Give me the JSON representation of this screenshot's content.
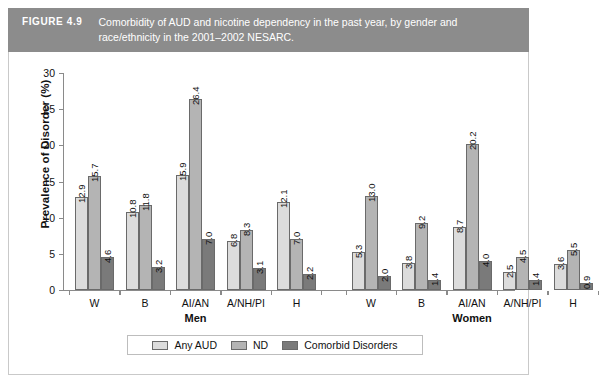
{
  "figure": {
    "number_label": "FIGURE 4.9",
    "caption": "Comorbidity of AUD and nicotine dependency in the past year, by gender and race/ethnicity in the 2001–2002 NESARC."
  },
  "chart_data": {
    "type": "bar",
    "title": "",
    "xlabel": "",
    "ylabel": "Prevalence of Disorder (%)",
    "ylim": [
      0,
      30
    ],
    "yticks": [
      0,
      5,
      10,
      15,
      20,
      25,
      30
    ],
    "ytick_labels": [
      "0",
      "5",
      "10",
      "15",
      "20",
      "25",
      "30"
    ],
    "grid": false,
    "legend_position": "bottom",
    "panels": [
      {
        "name": "Men",
        "categories": [
          "W",
          "B",
          "AI/AN",
          "A/NH/PI",
          "H"
        ]
      },
      {
        "name": "Women",
        "categories": [
          "W",
          "B",
          "AI/AN",
          "A/NH/PI",
          "H"
        ]
      }
    ],
    "categories": [
      "W",
      "B",
      "AI/AN",
      "A/NH/PI",
      "H",
      "W",
      "B",
      "AI/AN",
      "A/NH/PI",
      "H"
    ],
    "series": [
      {
        "name": "Any AUD",
        "color": "#dcdcdc",
        "values": [
          12.9,
          10.8,
          15.9,
          6.8,
          12.1,
          5.3,
          3.8,
          8.7,
          2.5,
          3.6
        ]
      },
      {
        "name": "ND",
        "color": "#b4b4b4",
        "values": [
          15.7,
          11.8,
          26.4,
          8.3,
          7.0,
          13.0,
          9.2,
          20.2,
          4.5,
          5.5
        ]
      },
      {
        "name": "Comorbid Disorders",
        "color": "#7a7a7a",
        "values": [
          4.6,
          3.2,
          7.0,
          3.1,
          2.2,
          2.0,
          1.4,
          4.0,
          1.4,
          0.9
        ]
      }
    ],
    "value_labels": [
      [
        "12.9",
        "15.7",
        "4.6"
      ],
      [
        "10.8",
        "11.8",
        "3.2"
      ],
      [
        "15.9",
        "26.4",
        "7.0"
      ],
      [
        "6.8",
        "8.3",
        "3.1"
      ],
      [
        "12.1",
        "7.0",
        "2.2"
      ],
      [
        "5.3",
        "13.0",
        "2.0"
      ],
      [
        "3.8",
        "9.2",
        "1.4"
      ],
      [
        "8.7",
        "20.2",
        "4.0"
      ],
      [
        "2.5",
        "4.5",
        "1.4"
      ],
      [
        "3.6",
        "5.5",
        "0.9"
      ]
    ]
  },
  "legend": {
    "entries": [
      {
        "label": "Any AUD"
      },
      {
        "label": "ND"
      },
      {
        "label": "Comorbid Disorders"
      }
    ]
  },
  "colors": {
    "header_band": "#8c8c8c",
    "series_any_aud": "#dcdcdc",
    "series_nd": "#b4b4b4",
    "series_comorbid": "#7a7a7a",
    "axis": "#8a8a8a",
    "frame": "#c9c9c9"
  }
}
